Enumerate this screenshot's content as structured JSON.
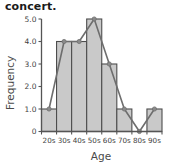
{
  "chart_data": {
    "type": "bar",
    "title": "concert.",
    "xlabel": "Age",
    "ylabel": "Frequency",
    "categories": [
      "20s",
      "30s",
      "40s",
      "50s",
      "60s",
      "70s",
      "80s",
      "90s"
    ],
    "values": [
      1,
      4,
      4,
      5,
      3,
      1,
      0,
      1
    ],
    "series": [
      {
        "name": "Histogram",
        "values": [
          1,
          4,
          4,
          5,
          3,
          1,
          0,
          1
        ]
      },
      {
        "name": "Frequency polygon",
        "values": [
          1,
          4,
          4,
          5,
          3,
          1,
          0,
          1
        ]
      }
    ],
    "ylim": [
      0,
      5
    ],
    "xlim": [
      0,
      8
    ],
    "ytick_labels": [
      "0",
      "1.0",
      "2.0",
      "3.0",
      "4.0",
      "5.0"
    ],
    "ytick_values": [
      0,
      1,
      2,
      3,
      4,
      5
    ],
    "xtick_labels": [
      "20s",
      "30s",
      "40s",
      "50s",
      "60s",
      "70s",
      "80s",
      "90s"
    ],
    "grid": false,
    "legend": "none",
    "bar_fill_color": "#c9c9c9",
    "bar_edge_color": "#4d4d4d",
    "line_color": "#6e6e6e",
    "marker_color": "#8a8a8a",
    "axis_color": "#555555"
  }
}
